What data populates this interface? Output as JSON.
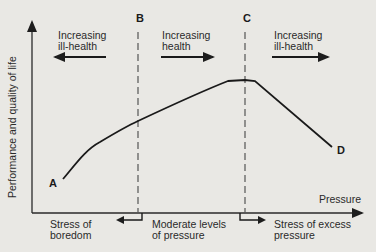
{
  "diagram": {
    "y_axis_label": "Performance and quality of life",
    "x_axis_label": "Pressure",
    "points": {
      "A": "A",
      "B": "B",
      "C": "C",
      "D": "D"
    },
    "zones_top": [
      {
        "line1": "Increasing",
        "line2": "ill-health",
        "direction": "left"
      },
      {
        "line1": "Increasing",
        "line2": "health",
        "direction": "right"
      },
      {
        "line1": "Increasing",
        "line2": "ill-health",
        "direction": "right"
      }
    ],
    "zones_bottom": [
      {
        "line1": "Stress of",
        "line2": "boredom"
      },
      {
        "line1": "Moderate levels",
        "line2": "of pressure"
      },
      {
        "line1": "Stress of excess",
        "line2": "pressure"
      }
    ],
    "curve": "A (low) rises to peak plateau near C, then falls to D",
    "colors": {
      "background": "#e9e8e4",
      "ink": "#1d1d1d",
      "dashed": "#555555"
    }
  }
}
